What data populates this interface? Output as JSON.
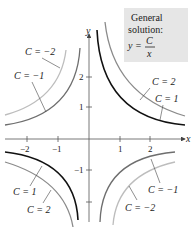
{
  "diagram": {
    "type": "function-family-graph",
    "formula_box": {
      "line1": "General",
      "line2": "solution:",
      "lhs": "y =",
      "numerator": "C",
      "denominator": "x",
      "background": "#e6e6e6"
    },
    "axes": {
      "x_label": "x",
      "y_label": "y",
      "x_ticks": [
        "−2",
        "−1",
        "1",
        "2"
      ],
      "y_ticks": [
        "2",
        "1",
        "−1",
        "−2"
      ]
    },
    "curves": [
      {
        "C": 1,
        "label": "C = 1",
        "color": "#111111"
      },
      {
        "C": 2,
        "label": "C = 2",
        "color": "#8a8a8a"
      },
      {
        "C": -1,
        "label": "C = −1",
        "color": "#6e6e6e"
      },
      {
        "C": -2,
        "label": "C = −2",
        "color": "#bdbdbd"
      }
    ],
    "labels": {
      "top_left_1": "C = −2",
      "top_left_2": "C = −1",
      "top_right_1": "C = 2",
      "top_right_2": "C = 1",
      "bottom_left_1": "C = 1",
      "bottom_left_2": "C = 2",
      "bottom_right_1": "C = −1",
      "bottom_right_2": "C = −2"
    }
  }
}
